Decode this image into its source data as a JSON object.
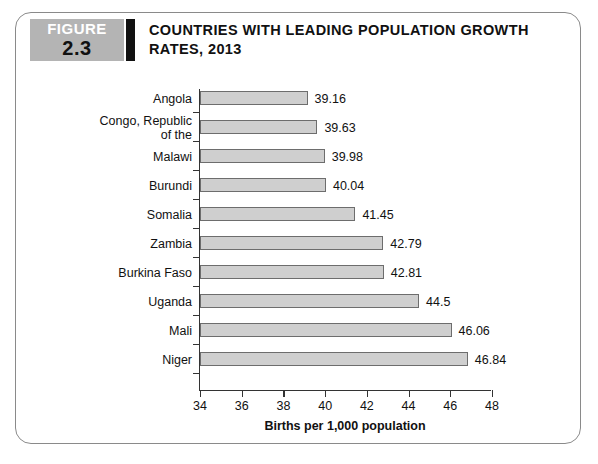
{
  "figure": {
    "badge_word": "FIGURE",
    "badge_number": "2.3",
    "title": "COUNTRIES WITH LEADING POPULATION GROWTH RATES, 2013"
  },
  "chart_data": {
    "type": "bar",
    "orientation": "horizontal",
    "title": "COUNTRIES WITH LEADING POPULATION GROWTH RATES, 2013",
    "categories": [
      "Angola",
      "Congo, Republic of the",
      "Malawi",
      "Burundi",
      "Somalia",
      "Zambia",
      "Burkina Faso",
      "Uganda",
      "Mali",
      "Niger"
    ],
    "category_lines": [
      [
        "Angola"
      ],
      [
        "Congo, Republic",
        "of the"
      ],
      [
        "Malawi"
      ],
      [
        "Burundi"
      ],
      [
        "Somalia"
      ],
      [
        "Zambia"
      ],
      [
        "Burkina Faso"
      ],
      [
        "Uganda"
      ],
      [
        "Mali"
      ],
      [
        "Niger"
      ]
    ],
    "values": [
      39.16,
      39.63,
      39.98,
      40.04,
      41.45,
      42.79,
      42.81,
      44.5,
      46.06,
      46.84
    ],
    "value_labels": [
      "39.16",
      "39.63",
      "39.98",
      "40.04",
      "41.45",
      "42.79",
      "42.81",
      "44.5",
      "46.06",
      "46.84"
    ],
    "xlabel": "Births per 1,000 population",
    "ylabel": "",
    "xlim": [
      34,
      48
    ],
    "xticks": [
      34,
      36,
      38,
      40,
      42,
      44,
      46,
      48
    ],
    "xtick_labels": [
      "34",
      "36",
      "38",
      "40",
      "42",
      "44",
      "46",
      "48"
    ],
    "grid": false,
    "legend": false,
    "bar_fill": "#cfcfcf",
    "bar_border": "#6d6d6d"
  }
}
